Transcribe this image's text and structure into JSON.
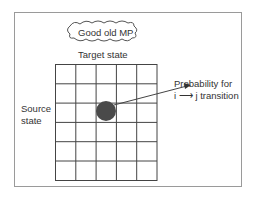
{
  "diagram": {
    "cloud_label": "Good old MP",
    "column_axis_label": "Target state",
    "row_axis_label_line1": "Source",
    "row_axis_label_line2": "state",
    "annotation_line1": "Probability for",
    "annotation_line2": "i ⟶ j transition",
    "grid": {
      "columns": 5,
      "rows": 6
    },
    "highlighted_cell": {
      "row": 3,
      "column": 3
    },
    "colors": {
      "frame": "#9a9a9a",
      "grid": "#444444",
      "dot": "#4a4a4a",
      "text": "#333333"
    }
  }
}
